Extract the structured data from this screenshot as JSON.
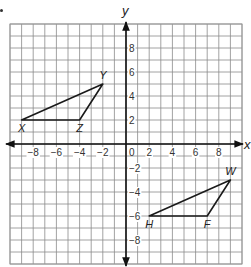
{
  "chart_data": {
    "type": "scatter",
    "title": "",
    "xlabel": "x",
    "ylabel": "y",
    "xlim": [
      -10,
      10
    ],
    "ylim": [
      -10,
      10
    ],
    "grid": true,
    "x_ticks": [
      -8,
      -6,
      -4,
      -2,
      0,
      2,
      4,
      6,
      8
    ],
    "y_ticks": [
      8,
      6,
      4,
      2,
      -2,
      -4,
      -6,
      -8
    ],
    "x_tick_labels": [
      "−8",
      "−6",
      "−4",
      "−2",
      "0",
      "2",
      "4",
      "6",
      "8"
    ],
    "y_tick_labels": [
      "8",
      "6",
      "4",
      "2",
      "−2",
      "−4",
      "−6",
      "−8"
    ],
    "series": [
      {
        "name": "Triangle XYZ",
        "closed": true,
        "points": [
          {
            "label": "X",
            "x": -9,
            "y": 2
          },
          {
            "label": "Y",
            "x": -2,
            "y": 5
          },
          {
            "label": "Z",
            "x": -4,
            "y": 2
          }
        ]
      },
      {
        "name": "Triangle HFW",
        "closed": true,
        "points": [
          {
            "label": "H",
            "x": 2,
            "y": -6
          },
          {
            "label": "F",
            "x": 7,
            "y": -6
          },
          {
            "label": "W",
            "x": 9,
            "y": -3
          }
        ]
      }
    ]
  },
  "colors": {
    "grid": "#8a8a8a",
    "axis": "#111111",
    "shape": "#1a1a1a",
    "border": "#9a9a9a"
  },
  "labels": {
    "x_axis": "x",
    "y_axis": "y"
  }
}
